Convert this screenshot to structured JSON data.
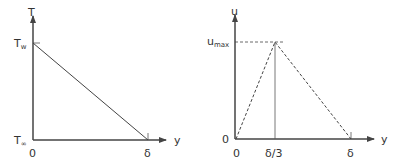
{
  "left_plot": {
    "y_axis_label": "T",
    "x_axis_label": "y",
    "top_label": "T",
    "top_label_sub": "w",
    "bottom_label": "T",
    "bottom_label_sub": "∞",
    "origin_label": "0",
    "end_label": "δ",
    "curve": "linear decrease from T_w at y=0 to T_∞ at y=δ"
  },
  "right_plot": {
    "y_axis_label": "u",
    "x_axis_label": "y",
    "peak_label": "u",
    "peak_label_sub": "max",
    "y_origin_label": "0",
    "x_origin_label": "0",
    "mid_label": "δ/3",
    "end_label": "δ",
    "curve": "dashed triangle: rises from 0 at y=0 to u_max at y=δ/3, falls to 0 at y=δ"
  },
  "colors": {
    "stroke": "#444444",
    "text": "#333333",
    "background": "#ffffff"
  }
}
